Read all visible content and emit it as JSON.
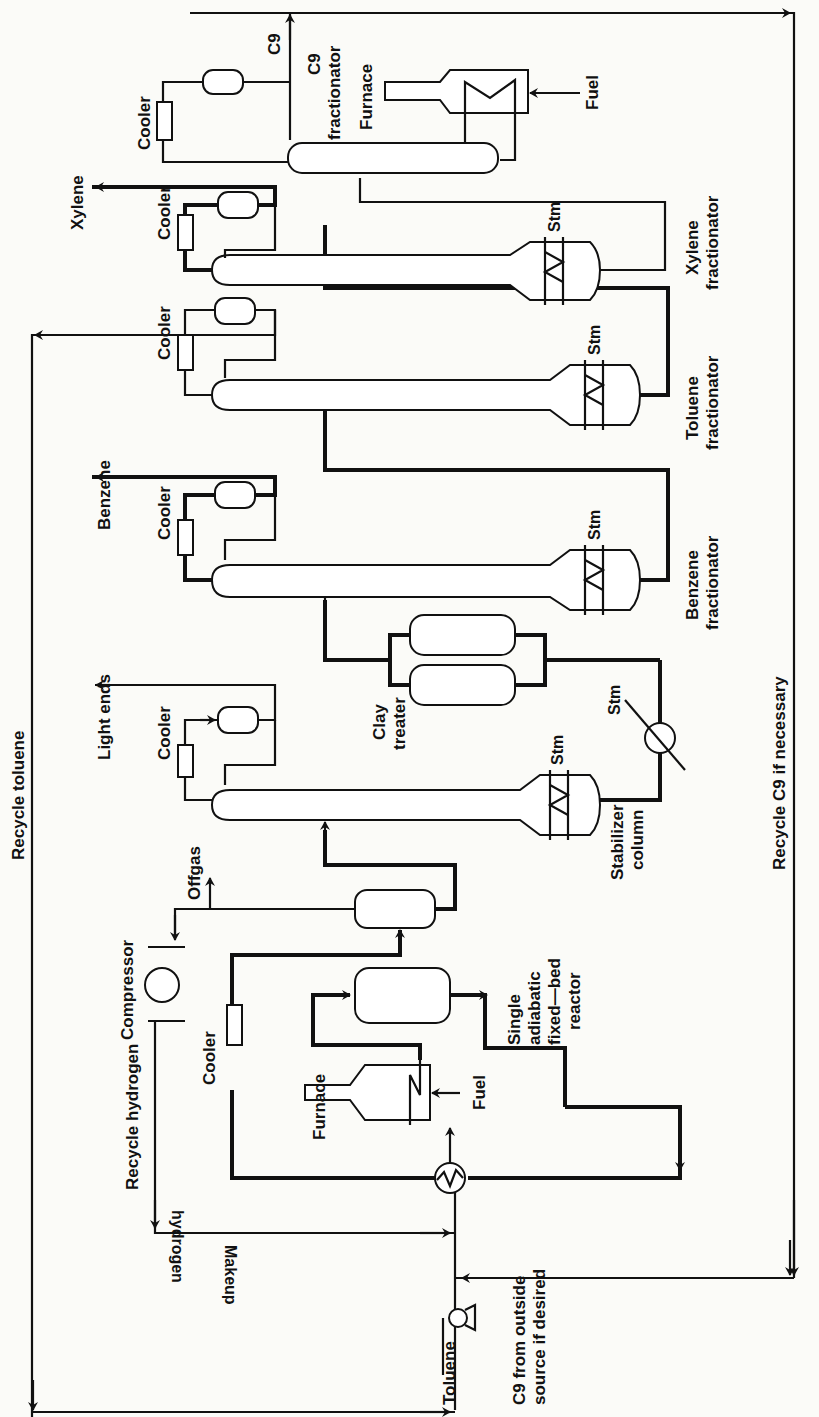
{
  "diagram": {
    "type": "process-flow-diagram",
    "orientation": "rotated-90-ccw",
    "caption_partial": "Figure 2  Toluene ... flow diagram (cut off at right edge)",
    "feeds": {
      "toluene": "Toluene",
      "c9_outside": "C9 from outside",
      "c9_outside_2": "source if desired",
      "makeup_h2_1": "Makeup",
      "makeup_h2_2": "hydrogen"
    },
    "recycles": {
      "toluene": "Recycle toluene",
      "hydrogen": "Recycle hydrogen",
      "c9": "Recycle C9 if necessary"
    },
    "equipment": {
      "furnace": "Furnace",
      "fuel": "Fuel",
      "reactor_1": "Single",
      "reactor_2": "adiabatic",
      "reactor_3": "fixed—bed",
      "reactor_4": "reactor",
      "cooler": "Cooler",
      "compressor": "Compressor",
      "offgas": "Offgas",
      "stabilizer_1": "Stabilizer",
      "stabilizer_2": "column",
      "light_ends": "Light ends",
      "clay_1": "Clay",
      "clay_2": "treater",
      "stm": "Stm",
      "benzene": "Benzene",
      "benzene_frac_1": "Benzene",
      "benzene_frac_2": "fractionator",
      "toluene_frac_1": "Toluene",
      "toluene_frac_2": "fractionator",
      "xylene": "Xylene",
      "xylene_frac_1": "Xylene",
      "xylene_frac_2": "fractionator",
      "c9": "C9",
      "c9_frac_1": "C9",
      "c9_frac_2": "fractionator",
      "furnace_c9": "Furnace",
      "fuel_c9": "Fuel"
    }
  }
}
